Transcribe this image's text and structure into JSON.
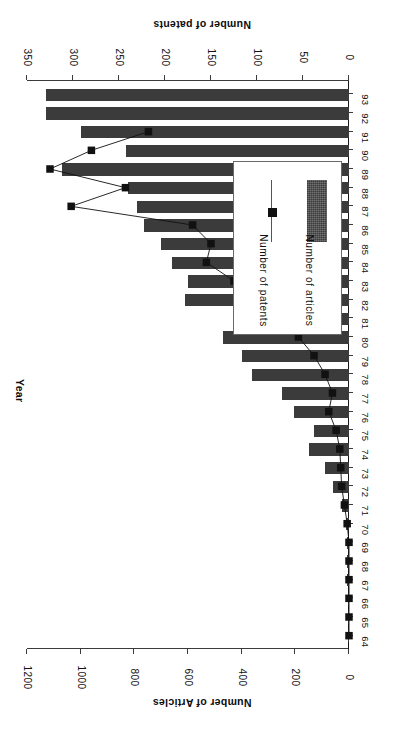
{
  "chart_data": {
    "type": "bar",
    "title": "",
    "subtitle": "",
    "xlabel": "Year",
    "ylabel": "Number of Articles",
    "y2label": "Number of patents",
    "orientation": "horizontal-rotated-180",
    "grid": false,
    "legend_position": "inside-left",
    "categories": [
      "64",
      "65",
      "66",
      "67",
      "68",
      "69",
      "70",
      "71",
      "72",
      "73",
      "74",
      "75",
      "76",
      "77",
      "78",
      "79",
      "80",
      "81",
      "82",
      "83",
      "84",
      "85",
      "86",
      "87",
      "88",
      "89",
      "90",
      "91",
      "92",
      "93"
    ],
    "axes": {
      "articles": {
        "label": "Number of Articles",
        "ticks": [
          0,
          200,
          400,
          600,
          800,
          1000,
          1200
        ],
        "tick_labels": [
          "0",
          "200",
          "400",
          "600",
          "800",
          "1000",
          "1200"
        ],
        "range": [
          0,
          1200
        ]
      },
      "patents": {
        "label": "Number of patents",
        "ticks": [
          0,
          50,
          100,
          150,
          200,
          250,
          300,
          350
        ],
        "tick_labels": [
          "0",
          "50",
          "100",
          "150",
          "200",
          "250",
          "300",
          "350"
        ],
        "range": [
          0,
          350
        ]
      },
      "year": {
        "label": "Year"
      }
    },
    "series": [
      {
        "name": "Number of articles",
        "type": "bar",
        "axis": "articles",
        "color": "#3b3b3b",
        "values": [
          2,
          4,
          5,
          6,
          7,
          8,
          12,
          26,
          58,
          90,
          150,
          130,
          205,
          250,
          360,
          400,
          470,
          430,
          610,
          600,
          660,
          700,
          765,
          790,
          825,
          1070,
          830,
          1000,
          1130,
          1130
        ]
      },
      {
        "name": "Number of patents",
        "type": "line",
        "axis": "patents",
        "color": "#111111",
        "marker": "square",
        "values": [
          0,
          0,
          0,
          0,
          0,
          0,
          2,
          5,
          8,
          9,
          10,
          14,
          22,
          18,
          26,
          38,
          55,
          70,
          95,
          125,
          155,
          150,
          170,
          302,
          243,
          325,
          280,
          218,
          null,
          null
        ]
      }
    ]
  },
  "legend": {
    "entries": [
      {
        "label": "Number of articles",
        "marker": "bar-swatch"
      },
      {
        "label": "Number of patents",
        "marker": "line-square-marker"
      }
    ]
  }
}
